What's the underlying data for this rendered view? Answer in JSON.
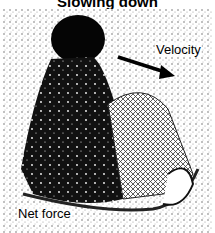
{
  "figure": {
    "title": "Slowing down",
    "labels": {
      "velocity": "Velocity",
      "net_force": "Net force"
    },
    "arrows": [
      {
        "name": "velocity-arrow",
        "direction": "right-down"
      }
    ],
    "colors": {
      "ink": "#000000",
      "background": "#ffffff"
    }
  }
}
